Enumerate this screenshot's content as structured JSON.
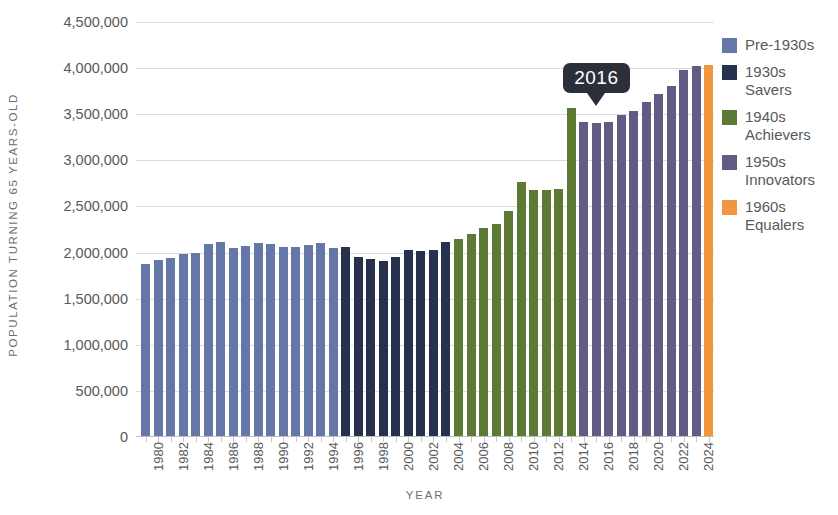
{
  "chart_data": {
    "type": "bar",
    "title": "",
    "xlabel": "YEAR",
    "ylabel": "POPULATION TURNING 65 YEARS-OLD",
    "ylim": [
      0,
      4500000
    ],
    "ytick_values": [
      0,
      500000,
      1000000,
      1500000,
      2000000,
      2500000,
      3000000,
      3500000,
      4000000,
      4500000
    ],
    "ytick_labels": [
      "0",
      "500,000",
      "1,000,000",
      "1,500,000",
      "2,000,000",
      "2,500,000",
      "3,000,000",
      "3,500,000",
      "4,000,000",
      "4,500,000"
    ],
    "grid": true,
    "legend_position": "right",
    "xtick_labels": [
      "1980",
      "1982",
      "1984",
      "1986",
      "1988",
      "1990",
      "1992",
      "1994",
      "1996",
      "1998",
      "2000",
      "2002",
      "2004",
      "2006",
      "2008",
      "2010",
      "2012",
      "2014",
      "2016",
      "2018",
      "2020",
      "2022",
      "2024"
    ],
    "categories": [
      "1980",
      "1981",
      "1982",
      "1983",
      "1984",
      "1985",
      "1986",
      "1987",
      "1988",
      "1989",
      "1990",
      "1991",
      "1992",
      "1993",
      "1994",
      "1995",
      "1996",
      "1997",
      "1998",
      "1999",
      "2000",
      "2001",
      "2002",
      "2003",
      "2004",
      "2005",
      "2006",
      "2007",
      "2008",
      "2009",
      "2010",
      "2011",
      "2012",
      "2013",
      "2014",
      "2015",
      "2016",
      "2017",
      "2018",
      "2019",
      "2020",
      "2021",
      "2022",
      "2023",
      "2024",
      "2025"
    ],
    "values": [
      1880000,
      1920000,
      1940000,
      1980000,
      1990000,
      2090000,
      2110000,
      2050000,
      2070000,
      2100000,
      2090000,
      2060000,
      2060000,
      2080000,
      2100000,
      2050000,
      2060000,
      1950000,
      1930000,
      1910000,
      1950000,
      2030000,
      2020000,
      2030000,
      2110000,
      2150000,
      2200000,
      2270000,
      2310000,
      2450000,
      2760000,
      2680000,
      2680000,
      2690000,
      3570000,
      3420000,
      3400000,
      3420000,
      3490000,
      3530000,
      3630000,
      3720000,
      3810000,
      3980000,
      4020000,
      4030000
    ],
    "bar_groups": [
      {
        "name": "Pre-1930s",
        "color": "#6477a8",
        "start_index": 0,
        "end_index": 15
      },
      {
        "name": "1930s Savers",
        "color": "#27304d",
        "start_index": 16,
        "end_index": 24
      },
      {
        "name": "1940s Achievers",
        "color": "#5d7a34",
        "start_index": 25,
        "end_index": 34
      },
      {
        "name": "1950s Innovators",
        "color": "#645b84",
        "start_index": 35,
        "end_index": 44
      },
      {
        "name": "1960s Equalers",
        "color": "#f2953f",
        "start_index": 45,
        "end_index": 45
      }
    ],
    "annotations": [
      {
        "label": "2016",
        "at_category": "2016",
        "value": 3400000
      }
    ],
    "legend": [
      {
        "label": "Pre-1930s",
        "color": "#6477a8"
      },
      {
        "label": "1930s\nSavers",
        "color": "#27304d"
      },
      {
        "label": "1940s\nAchievers",
        "color": "#5d7a34"
      },
      {
        "label": "1950s\nInnovators",
        "color": "#645b84"
      },
      {
        "label": "1960s\nEqualers",
        "color": "#f2953f"
      }
    ]
  }
}
